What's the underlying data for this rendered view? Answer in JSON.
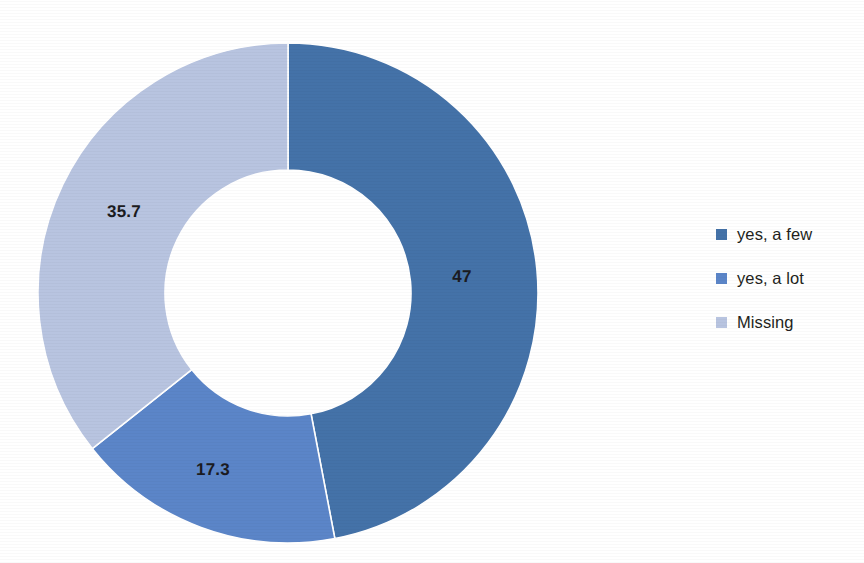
{
  "chart_data": {
    "type": "pie",
    "variant": "donut",
    "title": "",
    "subtitle": "",
    "xlabel": "",
    "ylabel": "",
    "grid": false,
    "legend_position": "right",
    "start_angle_deg": 0,
    "direction": "clockwise",
    "inner_radius_ratio": 0.49,
    "center": {
      "x": 288,
      "y": 293
    },
    "outer_radius": 250,
    "inner_radius": 123,
    "labels": [
      "yes, a few",
      "yes, a lot",
      "Missing"
    ],
    "values": [
      47,
      17.3,
      35.7
    ],
    "value_labels": [
      "47",
      "17.3",
      "35.7"
    ],
    "colors": [
      "#4472A8",
      "#5B85C8",
      "#B8C4E0"
    ],
    "slices": [
      {
        "label": "yes, a few",
        "value": 47,
        "value_label": "47",
        "color": "#4472A8",
        "start_deg": 0,
        "sweep_deg": 169.2,
        "label_x": 462,
        "label_y": 277
      },
      {
        "label": "yes, a lot",
        "value": 17.3,
        "value_label": "17.3",
        "color": "#5B85C8",
        "start_deg": 169.2,
        "sweep_deg": 62.3,
        "label_x": 213,
        "label_y": 470
      },
      {
        "label": "Missing",
        "value": 35.7,
        "value_label": "35.7",
        "color": "#B8C4E0",
        "start_deg": 231.5,
        "sweep_deg": 128.5,
        "label_x": 124,
        "label_y": 212
      }
    ]
  },
  "legend": {
    "items": [
      {
        "label": "yes, a few",
        "color": "#4472A8"
      },
      {
        "label": "yes, a lot",
        "color": "#5B85C8"
      },
      {
        "label": "Missing",
        "color": "#B8C4E0"
      }
    ]
  },
  "canvas": {
    "background": "#FFFFFF",
    "separator_color": "#FFFFFF"
  }
}
